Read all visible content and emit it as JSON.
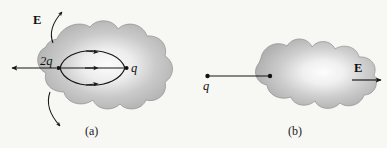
{
  "figure": {
    "background_color": "#f7f7f4",
    "ink_color": "#161616",
    "blob_fill_edge": "#b2b2b2",
    "blob_fill_center": "#fbfbfb",
    "panels": [
      {
        "id": "a",
        "caption": "(a)",
        "charges": [
          {
            "name": "source-charge-2q",
            "label": "2q",
            "x": 58,
            "y": 68
          },
          {
            "name": "source-charge-q",
            "label": "q",
            "x": 127,
            "y": 68
          }
        ],
        "field_label": "E",
        "field_label_position": "upper-left",
        "arrows": [
          {
            "name": "field-arrow-left",
            "direction": "left",
            "style": "straight"
          },
          {
            "name": "field-arrow-upper",
            "direction": "up-right",
            "style": "curved"
          },
          {
            "name": "field-arrow-lower",
            "direction": "down",
            "style": "curved"
          }
        ],
        "field_lines": 3,
        "field_line_direction": "left-to-right"
      },
      {
        "id": "b",
        "caption": "(b)",
        "charges": [
          {
            "name": "source-charge-q",
            "label": "q",
            "x": 207,
            "y": 76
          }
        ],
        "field_label": "E",
        "field_label_position": "right",
        "arrows": [
          {
            "name": "field-arrow-right",
            "direction": "right",
            "style": "straight"
          }
        ],
        "connector": {
          "name": "charge-connector-line",
          "from_x": 207,
          "to_x": 270
        }
      }
    ]
  }
}
